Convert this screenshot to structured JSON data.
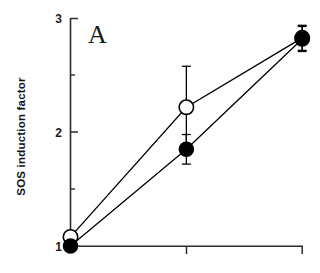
{
  "figure": {
    "panel_label": "A",
    "background_color": "#ffffff",
    "axis_color": "#2b2b2b"
  },
  "chart_data": {
    "type": "line",
    "title": "",
    "subtitle": "",
    "panel": "A",
    "xlabel": "",
    "ylabel": "SOS induction factor",
    "x": [
      0,
      1,
      2
    ],
    "xtick_labels": [
      "",
      "",
      ""
    ],
    "xlim": [
      0,
      2
    ],
    "ylim": [
      1,
      3
    ],
    "ytick_labels": [
      "1",
      "2",
      "3"
    ],
    "ytick_values": [
      1,
      2,
      3
    ],
    "yminor_tick_values": [
      1.5,
      2.5
    ],
    "grid": false,
    "legend": "none",
    "series": [
      {
        "name": "open-circle-series",
        "marker": "open-circle",
        "marker_face_color": "#ffffff",
        "marker_edge_color": "#000000",
        "line_color": "#000000",
        "values": [
          1.08,
          2.22,
          2.83
        ],
        "errors": [
          0.0,
          0.36,
          0.11
        ]
      },
      {
        "name": "filled-circle-series",
        "marker": "filled-circle",
        "marker_face_color": "#000000",
        "marker_edge_color": "#000000",
        "line_color": "#000000",
        "values": [
          1.0,
          1.85,
          2.82
        ],
        "errors": [
          0.0,
          0.13,
          0.11
        ]
      }
    ]
  },
  "axis": {
    "y_tick_1": "1",
    "y_tick_2": "2",
    "y_tick_3": "3"
  }
}
